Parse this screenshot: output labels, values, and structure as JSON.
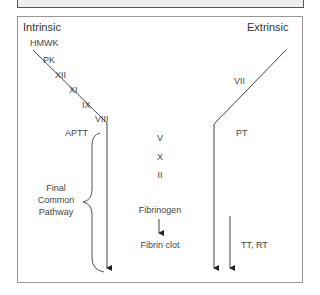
{
  "diagram": {
    "title_left": "Intrinsic",
    "title_right": "Extrinsic",
    "intrinsic_factors": [
      "HMWK",
      "PK",
      "XII",
      "XI",
      "IX",
      "VIII"
    ],
    "extrinsic_factors": [
      "VII"
    ],
    "common_factors": [
      "V",
      "X",
      "II"
    ],
    "labels": {
      "aptt": "APTT",
      "pt": "PT",
      "final_common_line1": "Final",
      "final_common_line2": "Common",
      "final_common_line3": "Pathway",
      "fibrinogen": "Fibrinogen",
      "fibrin_clot": "Fibrin clot",
      "tt_rt": "TT, RT"
    },
    "colors": {
      "line": "#333333",
      "frame": "#999999",
      "topbar": "#eeeeee"
    }
  }
}
